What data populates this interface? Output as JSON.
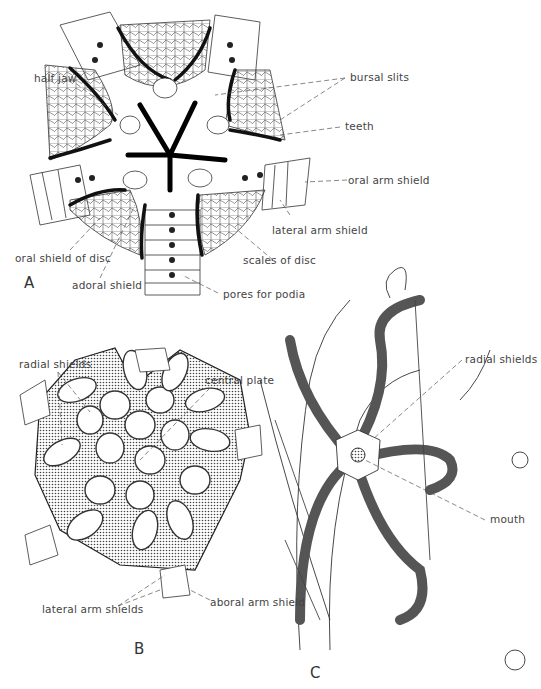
{
  "figure": {
    "panels": [
      {
        "id": "A",
        "label": "A",
        "labels": {
          "half_jaw": "half jaw",
          "bursal_slits": "bursal slits",
          "teeth": "teeth",
          "oral_arm_shield": "oral arm shield",
          "lateral_arm_shield": "lateral arm shield",
          "oral_shield_of_disc": "oral shield of disc",
          "scales_of_disc": "scales of disc",
          "adoral_shield": "adoral shield",
          "pores_for_podia": "pores for podia"
        }
      },
      {
        "id": "B",
        "label": "B",
        "labels": {
          "radial_shields": "radial shields",
          "central_plate": "central plate",
          "lateral_arm_shields": "lateral arm shields",
          "aboral_arm_shield": "aboral arm shield"
        }
      },
      {
        "id": "C",
        "label": "C",
        "labels": {
          "radial_shields": "radial shields",
          "mouth": "mouth"
        }
      }
    ]
  }
}
